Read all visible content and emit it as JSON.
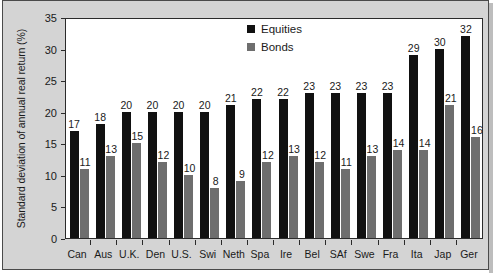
{
  "chart_data": {
    "type": "bar",
    "title": "",
    "xlabel": "",
    "ylabel": "Standard deviation of annual real return (%)",
    "ylim": [
      0,
      35
    ],
    "yticks": [
      0,
      5,
      10,
      15,
      20,
      25,
      30,
      35
    ],
    "grid": false,
    "legend_position": "top-center-right",
    "categories": [
      "Can",
      "Aus",
      "U.K.",
      "Den",
      "U.S.",
      "Swi",
      "Neth",
      "Spa",
      "Ire",
      "Bel",
      "SAf",
      "Swe",
      "Fra",
      "Ita",
      "Jap",
      "Ger"
    ],
    "series": [
      {
        "name": "Equities",
        "color": "#111111",
        "values": [
          17,
          18,
          20,
          20,
          20,
          20,
          21,
          22,
          22,
          23,
          23,
          23,
          23,
          29,
          30,
          32
        ]
      },
      {
        "name": "Bonds",
        "color": "#6e6e6e",
        "values": [
          11,
          13,
          15,
          12,
          10,
          8,
          9,
          12,
          13,
          12,
          11,
          13,
          14,
          14,
          21,
          16
        ]
      }
    ]
  },
  "legend": {
    "items": [
      {
        "label": "Equities",
        "key": "equities"
      },
      {
        "label": "Bonds",
        "key": "bonds"
      }
    ]
  }
}
